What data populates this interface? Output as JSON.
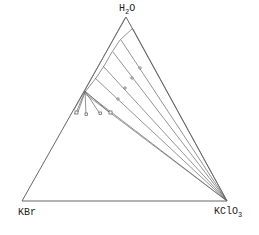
{
  "diagram": {
    "type": "ternary-phase-diagram",
    "vertices": {
      "top": {
        "label": "H",
        "sub": "2",
        "tail": "O"
      },
      "left": {
        "label": "KBr"
      },
      "right": {
        "label": "KClO",
        "sub": "3"
      }
    },
    "colors": {
      "line": "#555555",
      "text": "#222222",
      "background": "#ffffff"
    }
  }
}
